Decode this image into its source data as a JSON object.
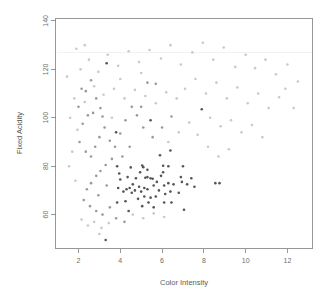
{
  "chart_data": {
    "type": "scatter",
    "title": "",
    "xlabel": "Color Intensity",
    "ylabel": "Fixed Acidity",
    "xlim": [
      0.9,
      13.2
    ],
    "ylim": [
      46,
      141
    ],
    "xticks": [
      2,
      4,
      6,
      8,
      10,
      12
    ],
    "yticks": [
      60,
      80,
      100,
      120,
      140
    ],
    "grid": false,
    "legend": null,
    "point_size_px": 2.6,
    "colors": {
      "dark_points": "#555555",
      "light_points": "#c2c2c2",
      "mid_points": "#9a9a9a",
      "axis": "#808080",
      "text": "#6e6e6e",
      "background": "#ffffff"
    },
    "series": [
      {
        "name": "dark-cluster",
        "color": "#555555",
        "points": [
          [
            3.3,
            49.5
          ],
          [
            3.35,
            122.5
          ],
          [
            3.8,
            94.0
          ],
          [
            5.45,
            99.0
          ],
          [
            3.85,
            80.0
          ],
          [
            4.5,
            79.5
          ],
          [
            5.05,
            80.3
          ],
          [
            5.1,
            79.6
          ],
          [
            6.05,
            80.2
          ],
          [
            6.3,
            80.0
          ],
          [
            7.0,
            80.0
          ],
          [
            6.4,
            86.5
          ],
          [
            5.9,
            84.5
          ],
          [
            6.05,
            77.5
          ],
          [
            5.95,
            76.0
          ],
          [
            5.3,
            75.5
          ],
          [
            5.45,
            75.0
          ],
          [
            5.55,
            74.8
          ],
          [
            5.2,
            75.2
          ],
          [
            4.75,
            75.0
          ],
          [
            4.6,
            72.5
          ],
          [
            4.45,
            71.0
          ],
          [
            4.3,
            70.5
          ],
          [
            4.0,
            74.5
          ],
          [
            3.9,
            71.0
          ],
          [
            4.15,
            69.5
          ],
          [
            4.55,
            69.0
          ],
          [
            4.7,
            70.0
          ],
          [
            4.9,
            71.5
          ],
          [
            5.0,
            69.5
          ],
          [
            5.15,
            71.0
          ],
          [
            5.3,
            70.5
          ],
          [
            5.6,
            72.0
          ],
          [
            5.75,
            73.5
          ],
          [
            5.85,
            70.0
          ],
          [
            6.1,
            72.0
          ],
          [
            6.3,
            73.0
          ],
          [
            6.55,
            72.5
          ],
          [
            6.95,
            73.5
          ],
          [
            7.2,
            72.5
          ],
          [
            7.4,
            75.0
          ],
          [
            7.55,
            71.5
          ],
          [
            8.55,
            73.0
          ],
          [
            8.75,
            73.0
          ],
          [
            3.85,
            65.0
          ],
          [
            4.25,
            65.5
          ],
          [
            4.4,
            61.5
          ],
          [
            5.05,
            63.5
          ],
          [
            5.35,
            65.0
          ],
          [
            5.6,
            63.0
          ],
          [
            6.1,
            65.0
          ],
          [
            6.45,
            65.0
          ],
          [
            7.05,
            62.0
          ],
          [
            5.45,
            67.0
          ],
          [
            5.15,
            67.5
          ],
          [
            4.85,
            66.5
          ],
          [
            6.15,
            68.5
          ],
          [
            6.4,
            69.5
          ],
          [
            6.8,
            69.0
          ],
          [
            5.7,
            67.5
          ],
          [
            4.95,
            77.5
          ],
          [
            5.3,
            78.5
          ],
          [
            4.35,
            75.5
          ],
          [
            3.95,
            77.0
          ],
          [
            6.9,
            75.5
          ],
          [
            7.9,
            103.5
          ]
        ]
      },
      {
        "name": "mid-scatter",
        "color": "#9a9a9a",
        "points": [
          [
            2.15,
            112.0
          ],
          [
            2.35,
            111.0
          ],
          [
            2.6,
            115.5
          ],
          [
            2.85,
            108.0
          ],
          [
            3.05,
            104.0
          ],
          [
            3.15,
            100.5
          ],
          [
            2.7,
            102.0
          ],
          [
            2.45,
            101.0
          ],
          [
            2.2,
            97.5
          ],
          [
            2.05,
            90.0
          ],
          [
            2.35,
            86.0
          ],
          [
            2.6,
            84.0
          ],
          [
            2.8,
            88.0
          ],
          [
            3.0,
            92.0
          ],
          [
            3.25,
            96.0
          ],
          [
            3.5,
            90.5
          ],
          [
            3.75,
            88.0
          ],
          [
            4.0,
            93.5
          ],
          [
            4.25,
            99.0
          ],
          [
            4.55,
            104.5
          ],
          [
            4.8,
            101.0
          ],
          [
            5.0,
            104.5
          ],
          [
            5.3,
            114.5
          ],
          [
            5.7,
            114.0
          ],
          [
            3.6,
            83.0
          ],
          [
            3.3,
            80.5
          ],
          [
            3.05,
            78.0
          ],
          [
            2.85,
            76.0
          ],
          [
            2.6,
            73.0
          ],
          [
            2.4,
            70.5
          ],
          [
            2.25,
            66.0
          ],
          [
            2.55,
            63.5
          ],
          [
            2.85,
            61.5
          ],
          [
            3.15,
            60.0
          ],
          [
            3.5,
            63.0
          ],
          [
            3.8,
            58.5
          ],
          [
            4.2,
            57.0
          ],
          [
            2.95,
            68.0
          ],
          [
            3.35,
            72.0
          ],
          [
            4.1,
            84.0
          ],
          [
            4.45,
            88.0
          ],
          [
            5.55,
            92.0
          ],
          [
            6.0,
            96.0
          ],
          [
            6.45,
            100.5
          ],
          [
            5.1,
            96.0
          ],
          [
            2.0,
            104.5
          ]
        ]
      },
      {
        "name": "light-scatter",
        "color": "#c9c9c9",
        "points": [
          [
            1.45,
            117.0
          ],
          [
            1.8,
            108.0
          ],
          [
            2.1,
            120.0
          ],
          [
            2.5,
            124.0
          ],
          [
            2.95,
            119.0
          ],
          [
            3.4,
            126.0
          ],
          [
            3.9,
            121.5
          ],
          [
            4.4,
            127.5
          ],
          [
            4.9,
            123.0
          ],
          [
            5.4,
            128.0
          ],
          [
            5.95,
            124.5
          ],
          [
            6.4,
            130.0
          ],
          [
            6.9,
            122.0
          ],
          [
            7.45,
            127.0
          ],
          [
            7.95,
            131.0
          ],
          [
            8.45,
            124.0
          ],
          [
            8.95,
            129.0
          ],
          [
            9.5,
            121.0
          ],
          [
            10.0,
            126.0
          ],
          [
            10.45,
            120.5
          ],
          [
            10.95,
            124.0
          ],
          [
            11.45,
            118.0
          ],
          [
            12.0,
            122.0
          ],
          [
            12.5,
            115.0
          ],
          [
            1.6,
            100.0
          ],
          [
            1.95,
            95.0
          ],
          [
            2.3,
            106.5
          ],
          [
            7.1,
            112.0
          ],
          [
            7.6,
            116.0
          ],
          [
            8.1,
            110.0
          ],
          [
            8.6,
            114.5
          ],
          [
            9.1,
            108.0
          ],
          [
            9.6,
            112.5
          ],
          [
            10.1,
            106.0
          ],
          [
            10.6,
            110.0
          ],
          [
            11.1,
            104.0
          ],
          [
            11.6,
            108.5
          ],
          [
            6.7,
            108.0
          ],
          [
            6.2,
            110.5
          ],
          [
            5.7,
            106.0
          ],
          [
            5.2,
            109.0
          ],
          [
            4.7,
            111.5
          ],
          [
            4.2,
            108.0
          ],
          [
            3.7,
            112.0
          ],
          [
            3.2,
            109.5
          ],
          [
            2.75,
            113.0
          ],
          [
            8.3,
            100.0
          ],
          [
            8.8,
            96.5
          ],
          [
            9.3,
            99.0
          ],
          [
            9.8,
            94.0
          ],
          [
            10.3,
            97.0
          ],
          [
            10.8,
            92.0
          ],
          [
            7.3,
            98.0
          ],
          [
            6.8,
            94.0
          ],
          [
            6.3,
            90.0
          ],
          [
            7.7,
            93.0
          ],
          [
            8.2,
            88.0
          ],
          [
            8.7,
            84.0
          ],
          [
            9.2,
            87.0
          ],
          [
            2.15,
            58.0
          ],
          [
            2.45,
            55.5
          ],
          [
            2.75,
            57.0
          ],
          [
            3.1,
            54.5
          ],
          [
            3.45,
            56.5
          ],
          [
            3.0,
            52.0
          ],
          [
            1.7,
            86.0
          ],
          [
            1.55,
            80.0
          ],
          [
            1.85,
            74.0
          ],
          [
            4.6,
            60.0
          ],
          [
            5.1,
            58.5
          ],
          [
            5.6,
            60.5
          ],
          [
            6.1,
            59.0
          ],
          [
            3.6,
            100.0
          ],
          [
            4.0,
            116.0
          ],
          [
            5.0,
            118.5
          ],
          [
            2.3,
            130.0
          ],
          [
            1.9,
            128.5
          ],
          [
            11.9,
            112.0
          ],
          [
            12.3,
            104.0
          ]
        ]
      }
    ],
    "artifact": {
      "type": "horizontal-line",
      "y": 127.0,
      "color": "#ededed"
    }
  },
  "axes": {
    "x_title": "Color Intensity",
    "y_title": "Fixed Acidity",
    "x_tick_labels": [
      "2",
      "4",
      "6",
      "8",
      "10",
      "12"
    ],
    "y_tick_labels": [
      "60",
      "80",
      "100",
      "120",
      "140"
    ]
  }
}
